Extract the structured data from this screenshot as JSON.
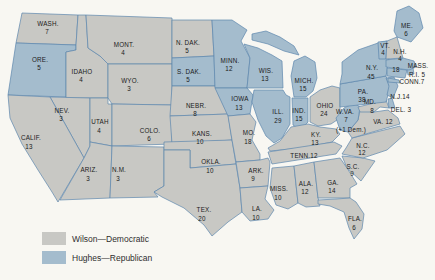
{
  "colors": {
    "wilson": "#c8c8c4",
    "hughes": "#a4bccd",
    "border": "#5d87ae",
    "background": "#f8f7f2",
    "label_text": "#1b1b1b"
  },
  "legend": {
    "wilson_label": "Wilson—Democratic",
    "hughes_label": "Hughes—Republican"
  },
  "states": {
    "wash": {
      "abbr": "WASH.",
      "votes": "7",
      "party": "wilson"
    },
    "ore": {
      "abbr": "ORE.",
      "votes": "5",
      "party": "hughes"
    },
    "calif": {
      "abbr": "CALIF.",
      "votes": "13",
      "party": "wilson"
    },
    "nev": {
      "abbr": "NEV.",
      "votes": "3",
      "party": "wilson"
    },
    "idaho": {
      "abbr": "IDAHO",
      "votes": "4",
      "party": "wilson"
    },
    "utah": {
      "abbr": "UTAH",
      "votes": "4",
      "party": "wilson"
    },
    "ariz": {
      "abbr": "ARIZ.",
      "votes": "3",
      "party": "wilson"
    },
    "mont": {
      "abbr": "MONT.",
      "votes": "4",
      "party": "wilson"
    },
    "wyo": {
      "abbr": "WYO.",
      "votes": "3",
      "party": "wilson"
    },
    "colo": {
      "abbr": "COLO.",
      "votes": "6",
      "party": "wilson"
    },
    "nm": {
      "abbr": "N.M.",
      "votes": "3",
      "party": "wilson"
    },
    "ndak": {
      "abbr": "N. DAK.",
      "votes": "5",
      "party": "wilson"
    },
    "sdak": {
      "abbr": "S. DAK.",
      "votes": "5",
      "party": "hughes"
    },
    "nebr": {
      "abbr": "NEBR.",
      "votes": "8",
      "party": "wilson"
    },
    "kans": {
      "abbr": "KANS.",
      "votes": "10",
      "party": "wilson"
    },
    "okla": {
      "abbr": "OKLA.",
      "votes": "10",
      "party": "wilson"
    },
    "tex": {
      "abbr": "TEX.",
      "votes": "20",
      "party": "wilson"
    },
    "minn": {
      "abbr": "MINN.",
      "votes": "12",
      "party": "hughes"
    },
    "iowa": {
      "abbr": "IOWA",
      "votes": "13",
      "party": "hughes"
    },
    "mo": {
      "abbr": "MO.",
      "votes": "18",
      "party": "wilson"
    },
    "ark": {
      "abbr": "ARK.",
      "votes": "9",
      "party": "wilson"
    },
    "la": {
      "abbr": "LA.",
      "votes": "10",
      "party": "wilson"
    },
    "wis": {
      "abbr": "WIS.",
      "votes": "13",
      "party": "hughes"
    },
    "ill": {
      "abbr": "ILL.",
      "votes": "29",
      "party": "hughes"
    },
    "miss": {
      "abbr": "MISS.",
      "votes": "10",
      "party": "wilson"
    },
    "mich": {
      "abbr": "MICH.",
      "votes": "15",
      "party": "hughes"
    },
    "ind": {
      "abbr": "IND.",
      "votes": "15",
      "party": "hughes"
    },
    "ky": {
      "abbr": "KY.",
      "votes": "13",
      "party": "wilson"
    },
    "tenn": {
      "abbr": "TENN.12",
      "votes": "",
      "party": "wilson"
    },
    "ala": {
      "abbr": "ALA.",
      "votes": "12",
      "party": "wilson"
    },
    "ohio": {
      "abbr": "OHIO",
      "votes": "24",
      "party": "wilson"
    },
    "wva": {
      "abbr": "W.VA.",
      "votes": "7",
      "note": "(+1 Dem.)",
      "party": "hughes"
    },
    "va": {
      "abbr": "VA. 12",
      "votes": "",
      "party": "wilson"
    },
    "nc": {
      "abbr": "N.C.",
      "votes": "12",
      "party": "wilson"
    },
    "sc": {
      "abbr": "S.C.",
      "votes": "9",
      "party": "wilson"
    },
    "ga": {
      "abbr": "GA.",
      "votes": "14",
      "party": "wilson"
    },
    "fla": {
      "abbr": "FLA.",
      "votes": "6",
      "party": "wilson"
    },
    "pa": {
      "abbr": "PA.",
      "votes": "38",
      "party": "hughes"
    },
    "ny": {
      "abbr": "N.Y.",
      "votes": "45",
      "party": "hughes"
    },
    "vt": {
      "abbr": "VT.",
      "votes": "4",
      "party": "hughes"
    },
    "nh": {
      "abbr": "N.H.",
      "votes": "4",
      "party": "wilson"
    },
    "me": {
      "abbr": "ME.",
      "votes": "6",
      "party": "hughes"
    },
    "mass": {
      "abbr": "MASS.",
      "votes": "18",
      "party": "hughes"
    },
    "ri": {
      "abbr": "R.I. 5",
      "votes": "",
      "party": "hughes"
    },
    "conn": {
      "abbr": "CONN.7",
      "votes": "",
      "party": "hughes"
    },
    "nj": {
      "abbr": "N.J.14",
      "votes": "",
      "party": "hughes"
    },
    "del": {
      "abbr": "DEL. 3",
      "votes": "",
      "party": "hughes"
    },
    "md": {
      "abbr": "MD.",
      "votes": "8",
      "party": "wilson"
    }
  }
}
